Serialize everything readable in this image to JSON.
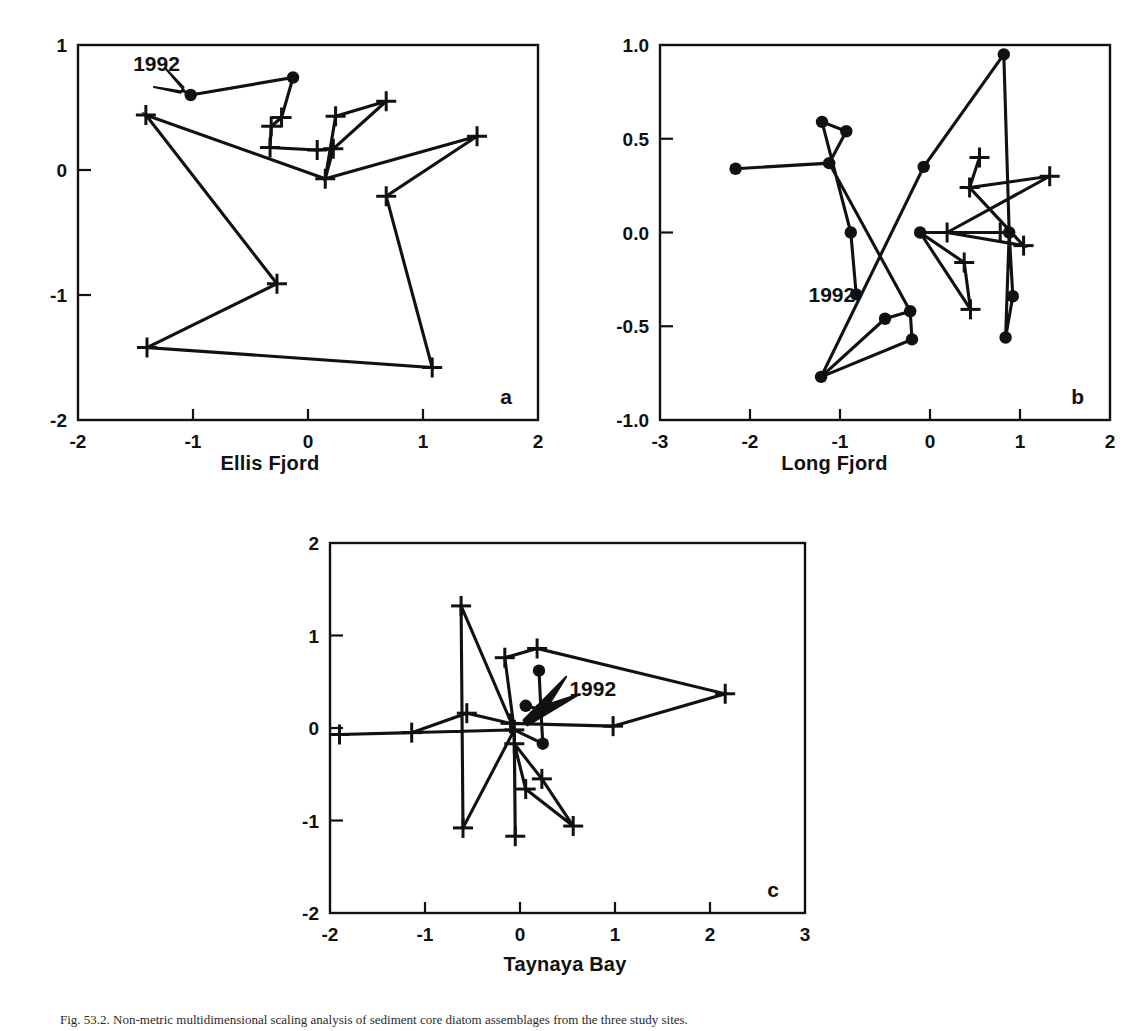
{
  "figure": {
    "caption": "Fig. 53.2. Non-metric multidimensional scaling analysis of sediment core diatom assemblages from the three study sites.",
    "year_label": "1992"
  },
  "chart_data": [
    {
      "type": "scatter",
      "panel_letter": "a",
      "title": "Ellis Fjord",
      "xlabel": "",
      "ylabel": "",
      "xlim": [
        -2,
        2
      ],
      "ylim": [
        -2,
        1
      ],
      "xticks": [
        -2,
        -1,
        0,
        1,
        2
      ],
      "yticks": [
        1,
        0,
        -1,
        -2
      ],
      "xtick_labels": [
        "-2",
        "-1",
        "0",
        "1",
        "2"
      ],
      "ytick_labels": [
        "1",
        "0",
        "-1",
        "-2"
      ],
      "grid": false,
      "legend": "none",
      "annotation": {
        "text": "1992",
        "x": -1.52,
        "y": 0.86,
        "arrow_to": [
          -1.02,
          0.6
        ]
      },
      "series": [
        {
          "name": "trajectory",
          "marker_note": "filled circles = most recent samples (1992 end), plus signs = older samples",
          "points": [
            {
              "x": -1.02,
              "y": 0.6,
              "marker": "dot"
            },
            {
              "x": -0.13,
              "y": 0.74,
              "marker": "dot"
            },
            {
              "x": -0.23,
              "y": 0.42,
              "marker": "plus"
            },
            {
              "x": -0.32,
              "y": 0.35,
              "marker": "plus"
            },
            {
              "x": -0.33,
              "y": 0.18,
              "marker": "plus"
            },
            {
              "x": 0.68,
              "y": 0.55,
              "marker": "plus"
            },
            {
              "x": 0.08,
              "y": 0.16,
              "marker": "plus"
            },
            {
              "x": 0.24,
              "y": 0.43,
              "marker": "plus"
            },
            {
              "x": 0.22,
              "y": 0.17,
              "marker": "plus"
            },
            {
              "x": 0.15,
              "y": -0.07,
              "marker": "plus"
            },
            {
              "x": 1.47,
              "y": 0.27,
              "marker": "plus"
            },
            {
              "x": 0.68,
              "y": -0.21,
              "marker": "plus"
            },
            {
              "x": 1.08,
              "y": -1.58,
              "marker": "plus"
            },
            {
              "x": -1.41,
              "y": 0.44,
              "marker": "plus"
            },
            {
              "x": -0.27,
              "y": -0.91,
              "marker": "plus"
            },
            {
              "x": -1.4,
              "y": -1.42,
              "marker": "plus"
            }
          ],
          "path_order": [
            0,
            1,
            2,
            3,
            4,
            6,
            8,
            9,
            7,
            5,
            8,
            9,
            10,
            11,
            12,
            15,
            14,
            13,
            9
          ]
        }
      ]
    },
    {
      "type": "scatter",
      "panel_letter": "b",
      "title": "Long Fjord",
      "xlabel": "",
      "ylabel": "",
      "xlim": [
        -3,
        2
      ],
      "ylim": [
        -1.0,
        1.0
      ],
      "xticks": [
        -3,
        -2,
        -1,
        0,
        1,
        2
      ],
      "yticks": [
        1.0,
        0.5,
        0.0,
        -0.5,
        -1.0
      ],
      "xtick_labels": [
        "-3",
        "-2",
        "-1",
        "0",
        "1",
        "2"
      ],
      "ytick_labels": [
        "1.0",
        "0.5",
        "0.0",
        "-0.5",
        "-1.0"
      ],
      "grid": false,
      "legend": "none",
      "annotation": {
        "text": "1992",
        "x": -1.35,
        "y": -0.33,
        "arrow_to": null
      },
      "series": [
        {
          "name": "trajectory",
          "marker_note": "filled circles = recent samples, plus signs = older samples",
          "points": [
            {
              "x": -0.82,
              "y": -0.33,
              "marker": "dot"
            },
            {
              "x": -0.88,
              "y": 0.0,
              "marker": "dot"
            },
            {
              "x": -1.2,
              "y": 0.59,
              "marker": "dot"
            },
            {
              "x": -0.93,
              "y": 0.54,
              "marker": "dot"
            },
            {
              "x": -2.16,
              "y": 0.34,
              "marker": "dot"
            },
            {
              "x": -1.12,
              "y": 0.37,
              "marker": "dot"
            },
            {
              "x": -0.22,
              "y": -0.42,
              "marker": "dot"
            },
            {
              "x": -0.2,
              "y": -0.57,
              "marker": "dot"
            },
            {
              "x": -1.21,
              "y": -0.77,
              "marker": "dot"
            },
            {
              "x": -0.5,
              "y": -0.46,
              "marker": "dot"
            },
            {
              "x": -0.07,
              "y": 0.35,
              "marker": "dot"
            },
            {
              "x": 0.82,
              "y": 0.95,
              "marker": "dot"
            },
            {
              "x": 0.88,
              "y": 0.0,
              "marker": "dot"
            },
            {
              "x": 0.92,
              "y": -0.34,
              "marker": "dot"
            },
            {
              "x": 0.84,
              "y": -0.56,
              "marker": "dot"
            },
            {
              "x": -0.11,
              "y": 0.0,
              "marker": "dot"
            },
            {
              "x": 0.55,
              "y": 0.4,
              "marker": "plus"
            },
            {
              "x": 0.44,
              "y": 0.24,
              "marker": "plus"
            },
            {
              "x": 1.33,
              "y": 0.3,
              "marker": "plus"
            },
            {
              "x": 0.19,
              "y": 0.0,
              "marker": "plus"
            },
            {
              "x": 0.78,
              "y": 0.0,
              "marker": "plus"
            },
            {
              "x": 1.04,
              "y": -0.07,
              "marker": "plus"
            },
            {
              "x": 0.38,
              "y": -0.16,
              "marker": "plus"
            },
            {
              "x": 0.45,
              "y": -0.41,
              "marker": "plus"
            }
          ],
          "path_order": [
            0,
            1,
            2,
            3,
            5,
            4,
            5,
            6,
            7,
            8,
            9,
            6,
            7,
            8,
            10,
            11,
            12,
            13,
            14,
            12,
            15,
            22,
            23,
            15,
            19,
            21,
            17,
            16,
            17,
            18,
            19,
            20,
            12
          ]
        }
      ]
    },
    {
      "type": "scatter",
      "panel_letter": "c",
      "title": "Taynaya Bay",
      "xlabel": "",
      "ylabel": "",
      "xlim": [
        -2,
        3
      ],
      "ylim": [
        -2,
        2
      ],
      "xticks": [
        -2,
        -1,
        0,
        1,
        2,
        3
      ],
      "yticks": [
        2,
        1,
        0,
        -1,
        -2
      ],
      "xtick_labels": [
        "-2",
        "-1",
        "0",
        "1",
        "2",
        "3"
      ],
      "ytick_labels": [
        "2",
        "1",
        "0",
        "-1",
        "-2"
      ],
      "grid": false,
      "legend": "none",
      "annotation": {
        "text": "1992",
        "x": 0.52,
        "y": 0.43,
        "arrow_to": [
          0.26,
          0.22
        ]
      },
      "series": [
        {
          "name": "trajectory",
          "marker_note": "filled circles = recent samples, plus signs = older samples",
          "points": [
            {
              "x": 0.2,
              "y": 0.62,
              "marker": "dot"
            },
            {
              "x": 0.06,
              "y": 0.24,
              "marker": "dot"
            },
            {
              "x": 0.22,
              "y": 0.2,
              "marker": "dot"
            },
            {
              "x": 0.24,
              "y": -0.17,
              "marker": "dot"
            },
            {
              "x": -0.16,
              "y": 0.76,
              "marker": "plus"
            },
            {
              "x": 0.18,
              "y": 0.86,
              "marker": "plus"
            },
            {
              "x": 2.16,
              "y": 0.37,
              "marker": "plus"
            },
            {
              "x": 0.98,
              "y": 0.02,
              "marker": "plus"
            },
            {
              "x": -0.62,
              "y": 1.32,
              "marker": "plus"
            },
            {
              "x": -1.9,
              "y": -0.07,
              "marker": "plus"
            },
            {
              "x": -1.14,
              "y": -0.05,
              "marker": "plus"
            },
            {
              "x": -0.56,
              "y": 0.16,
              "marker": "plus"
            },
            {
              "x": -0.1,
              "y": 0.05,
              "marker": "plus"
            },
            {
              "x": -0.06,
              "y": -0.02,
              "marker": "plus"
            },
            {
              "x": -0.6,
              "y": -1.08,
              "marker": "plus"
            },
            {
              "x": -0.06,
              "y": -0.17,
              "marker": "plus"
            },
            {
              "x": -0.05,
              "y": -1.17,
              "marker": "plus"
            },
            {
              "x": 0.23,
              "y": -0.55,
              "marker": "plus"
            },
            {
              "x": 0.06,
              "y": -0.66,
              "marker": "plus"
            },
            {
              "x": 0.56,
              "y": -1.06,
              "marker": "plus"
            }
          ],
          "path_order": [
            0,
            2,
            1,
            2,
            3,
            13,
            12,
            11,
            10,
            9,
            13,
            4,
            5,
            6,
            7,
            12,
            13,
            15,
            17,
            19,
            18,
            15,
            16,
            13,
            8,
            14,
            13
          ]
        }
      ]
    }
  ]
}
